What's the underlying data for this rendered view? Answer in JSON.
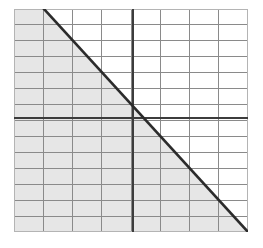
{
  "figure": {
    "title": "",
    "background_color": "#ffffff"
  },
  "chart_data": {
    "type": "line",
    "title": "",
    "xlabel": "",
    "ylabel": "",
    "grid": {
      "visible": true,
      "columns": 8,
      "rows": 14,
      "minor_line_color": "#8a8a8a",
      "minor_line_width": 1,
      "cell_width": 29.3,
      "cell_height": 16.35,
      "border_color": "#b4b4b4",
      "border_width": 1
    },
    "plot_area": {
      "x_left": 14,
      "x_right": 248,
      "y_top": 9,
      "y_bottom": 232
    },
    "axes": [
      {
        "name": "y-axis",
        "orientation": "vertical",
        "pixel_position": 133,
        "grid_index": 4,
        "color": "#3c3c3c",
        "line_width": 2
      },
      {
        "name": "x-axis",
        "orientation": "horizontal",
        "pixel_position": 118,
        "grid_index": 7,
        "color": "#3c3c3c",
        "line_width": 2
      }
    ],
    "series": [
      {
        "name": "boundary-line",
        "type": "line",
        "style": "solid",
        "color": "#2b2b2b",
        "line_width": 2.6,
        "points": [
          {
            "x": 44,
            "y": 9
          },
          {
            "x": 248,
            "y": 232
          }
        ],
        "slope_pixels": -1.093,
        "x_intercept_grid": 3.93,
        "y_intercept_grid": 4.02
      }
    ],
    "shaded_region": {
      "name": "solution-region",
      "fill_color": "#e6e6e6",
      "side": "below-left",
      "polygon": [
        {
          "x": 14,
          "y": 9
        },
        {
          "x": 44,
          "y": 9
        },
        {
          "x": 248,
          "y": 232
        },
        {
          "x": 14,
          "y": 232
        }
      ]
    },
    "legend": {
      "visible": false
    },
    "tick_labels": {
      "visible": false
    },
    "annotations": []
  }
}
